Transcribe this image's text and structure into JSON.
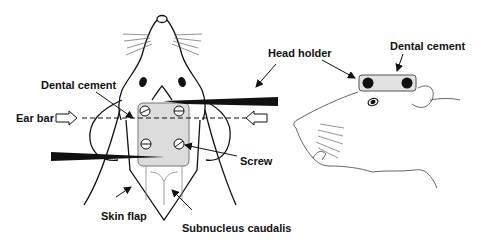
{
  "figure": {
    "colors": {
      "line": "#111111",
      "thin_line": "#555555",
      "cement_fill": "#dcdcdc",
      "background": "#ffffff"
    }
  },
  "labels": {
    "dental_cement_left": "Dental cement",
    "ear_bar": "Ear bar",
    "skin_flap": "Skin flap",
    "subnucleus_caudalis": "Subnucleus caudalis",
    "screw": "Screw",
    "head_holder": "Head holder",
    "dental_cement_right": "Dental cement"
  },
  "panels": [
    {
      "id": "dorsal-view",
      "elements": [
        "rat head (dorsal)",
        "dental cement block",
        "4 screws",
        "2 head holder bars",
        "ear bars (dashed line)",
        "skin flap",
        "subnucleus caudalis"
      ]
    },
    {
      "id": "lateral-view",
      "elements": [
        "rat head (lateral)",
        "head holder block with dental cement",
        "2 screws"
      ]
    }
  ]
}
